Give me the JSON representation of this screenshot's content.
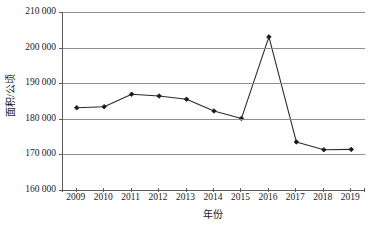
{
  "chart_data": {
    "type": "line",
    "title": "",
    "xlabel": "年份",
    "ylabel": "面积/公顷",
    "x": [
      2009,
      2010,
      2011,
      2012,
      2013,
      2014,
      2015,
      2016,
      2017,
      2018,
      2019
    ],
    "categories": [
      "2009",
      "2010",
      "2011",
      "2012",
      "2013",
      "2014",
      "2015",
      "2016",
      "2017",
      "2018",
      "2019"
    ],
    "values": [
      183100,
      183400,
      186900,
      186400,
      185500,
      182200,
      180100,
      203000,
      173500,
      171300,
      171400
    ],
    "series": [
      {
        "name": "面积/公顷",
        "values": [
          183100,
          183400,
          186900,
          186400,
          185500,
          182200,
          180100,
          203000,
          173500,
          171300,
          171400
        ]
      }
    ],
    "ylim": [
      160000,
      210000
    ],
    "ytick_values": [
      160000,
      170000,
      180000,
      190000,
      200000,
      210000
    ],
    "ytick_labels": [
      "160 000",
      "170 000",
      "180 000",
      "190 000",
      "200 000",
      "210 000"
    ],
    "xtick_labels": [
      "2009",
      "2010",
      "2011",
      "2012",
      "2013",
      "2014",
      "2015",
      "2016",
      "2017",
      "2018",
      "2019"
    ],
    "grid": "horizontal",
    "legend": "none",
    "marker": "diamond",
    "line_color": "#2b2b2b",
    "marker_color": "#1a1a1a",
    "grid_color": "#8e8e8e",
    "axis_color": "#5a5a5a",
    "background": "#ffffff"
  }
}
